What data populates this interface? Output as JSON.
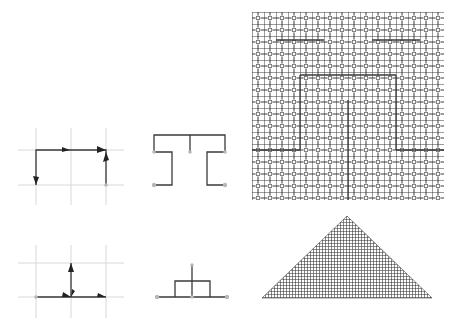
{
  "figure": {
    "colors": {
      "line": "#3a3a3a",
      "grid": "#d8d8d8",
      "node": "#b8b8b8",
      "arrow": "#222222",
      "background": "#ffffff"
    },
    "panels": [
      {
        "id": "generator-a",
        "row": 1,
        "col": 1,
        "type": "generator with arrows on grid"
      },
      {
        "id": "iteration-a",
        "row": 1,
        "col": 2,
        "type": "first iteration H-shape"
      },
      {
        "id": "fractal-a",
        "row": 1,
        "col": 3,
        "type": "square space-filling fractal"
      },
      {
        "id": "generator-b",
        "row": 2,
        "col": 1,
        "type": "generator with arrows on grid"
      },
      {
        "id": "iteration-b",
        "row": 2,
        "col": 2,
        "type": "first iteration box-stem shape"
      },
      {
        "id": "fractal-b",
        "row": 2,
        "col": 3,
        "type": "triangular space-filling fractal"
      }
    ]
  }
}
